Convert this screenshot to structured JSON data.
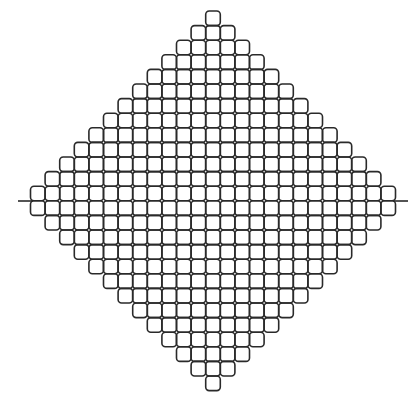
{
  "figure": {
    "background": "#ffffff",
    "stroke_color": "#2a2a2a",
    "stroke_width": 1.6,
    "cell_size": 14.6,
    "corner_radius": 3.5,
    "center_x": 213,
    "top_y": 11,
    "rows": 26,
    "tails": [
      {
        "side": "left",
        "x1": 18,
        "x2": 33,
        "y": 201
      },
      {
        "side": "right",
        "x1": 393,
        "x2": 408,
        "y": 201
      }
    ]
  }
}
